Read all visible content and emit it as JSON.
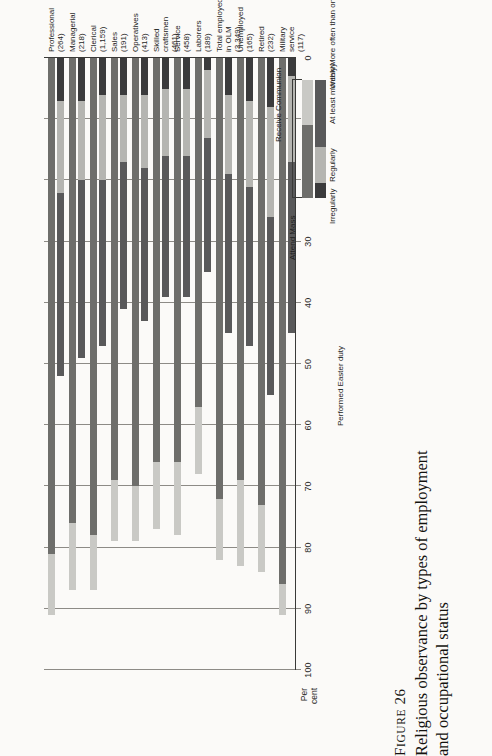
{
  "figure": {
    "number_prefix": "F",
    "number_smallcaps": "IGURE",
    "number": "26",
    "caption_line1": "Religious observance by types of employment",
    "caption_line2": "and occupational status"
  },
  "axis": {
    "unit_label_line1": "Per",
    "unit_label_line2": "cent",
    "ticks": [
      "0",
      "10",
      "20",
      "30",
      "40",
      "50",
      "60",
      "70",
      "80",
      "90",
      "100"
    ],
    "min": 0,
    "max": 100
  },
  "annotations": {
    "easter_duty": "Performed Easter duty"
  },
  "legend": {
    "group1_title": "Attend Mass",
    "group1_items": [
      "Irregularly",
      "Regularly"
    ],
    "group2_title": "Receive Communion",
    "group2_items": [
      "At least monthly",
      "Weekly",
      "More often than once a week"
    ]
  },
  "colors": {
    "regularly": "#6e6e6b",
    "irregularly": "#c9c9c5",
    "at_least_monthly": "#59595a",
    "weekly": "#b5b5b1",
    "more_often": "#3b3b3c",
    "gridline": "#8d8b86",
    "axis": "#3a3a38",
    "background": "#fbfaf8"
  },
  "chart_data": {
    "type": "bar",
    "title": "Religious observance by types of employment and occupational status",
    "xlabel": "Per cent",
    "ylabel": "",
    "xlim": [
      0,
      100
    ],
    "grid": true,
    "orientation": "horizontal",
    "legend_position": "right",
    "categories": [
      "Professional (264)",
      "Managerial (218)",
      "Clerical (1,159)",
      "Sales (191)",
      "Operatives (413)",
      "Skilled craftsmen (461)",
      "Service (458)",
      "Laborers (189)",
      "Total employed in OLM (3,349)",
      "Unemployed (165)",
      "Retired (232)",
      "Military service (117)"
    ],
    "category_labels": [
      [
        "Professional",
        "(264)"
      ],
      [
        "Managerial",
        "(218)"
      ],
      [
        "Clerical",
        "(1,159)"
      ],
      [
        "Sales",
        "(191)"
      ],
      [
        "Operatives",
        "(413)"
      ],
      [
        "Skilled",
        "craftsmen",
        "(461)"
      ],
      [
        "Service",
        "(458)"
      ],
      [
        "Laborers",
        "(189)"
      ],
      [
        "Total employed",
        "in OLM",
        "(3,349)"
      ],
      [
        "Unemployed",
        "(165)"
      ],
      [
        "Retired",
        "(232)"
      ],
      [
        "Military",
        "service",
        "(117)"
      ]
    ],
    "series": [
      {
        "name": "Regularly",
        "stack": "Attend Mass",
        "values": [
          81,
          76,
          78,
          69,
          70,
          66,
          66,
          57,
          72,
          69,
          73,
          86
        ]
      },
      {
        "name": "Irregularly",
        "stack": "Attend Mass",
        "values": [
          10,
          11,
          9,
          10,
          9,
          11,
          12,
          11,
          10,
          14,
          11,
          5
        ]
      },
      {
        "name": "More often than once a week",
        "stack": "Receive Communion",
        "values": [
          7,
          7,
          6,
          6,
          6,
          5,
          5,
          2,
          6,
          7,
          8,
          3
        ]
      },
      {
        "name": "Weekly",
        "stack": "Receive Communion",
        "values": [
          15,
          13,
          14,
          11,
          12,
          11,
          11,
          11,
          13,
          14,
          18,
          14
        ]
      },
      {
        "name": "At least monthly",
        "stack": "Receive Communion",
        "values": [
          30,
          29,
          27,
          24,
          25,
          23,
          23,
          22,
          26,
          26,
          29,
          28
        ]
      }
    ],
    "mass_totals": [
      91,
      87,
      87,
      79,
      79,
      77,
      78,
      68,
      82,
      83,
      84,
      91
    ],
    "communion_totals": [
      52,
      49,
      47,
      41,
      43,
      39,
      39,
      35,
      45,
      47,
      55,
      45
    ]
  }
}
